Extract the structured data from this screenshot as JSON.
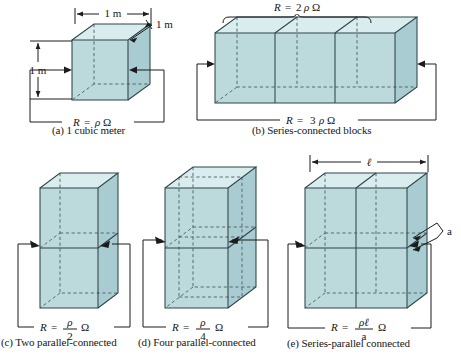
{
  "figure": {
    "background_color": "#ffffff",
    "block_colors": {
      "front_face": "#bcd9dc",
      "top_face": "#d9ecee",
      "side_face": "#a8ccd1",
      "edge": "#2f4449",
      "hidden_edge": "#4b5f64",
      "wire": "#1c1c1c"
    }
  },
  "panels": [
    {
      "id": "a",
      "caption": "(a) 1 cubic meter",
      "resistance_label": "R = ρΩ",
      "resistance_parts": {
        "r": "R",
        "eq": "=",
        "rho": "ρ",
        "ohm": "Ω"
      },
      "dimensions": {
        "width": "1 m",
        "height": "1 m",
        "depth": "1 m"
      },
      "block_count": 1,
      "arrangement": "single cube"
    },
    {
      "id": "b",
      "caption": "(b) Series-connected blocks",
      "resistance_label": "R = 3 ρΩ",
      "resistance_parts": {
        "r": "R",
        "eq": "=",
        "coef": "3",
        "rho": "ρ",
        "ohm": "Ω"
      },
      "brace_label": "R = 2 ρΩ",
      "brace_parts": {
        "r": "R",
        "eq": "=",
        "coef": "2",
        "rho": "ρ",
        "ohm": "Ω"
      },
      "block_count": 3,
      "arrangement": "three cubes in a row"
    },
    {
      "id": "c",
      "caption": "(c) Two parallel-connected",
      "resistance_label": "R = ρ/2 Ω",
      "resistance_parts": {
        "r": "R",
        "eq": "=",
        "num": "ρ",
        "den": "2",
        "ohm": "Ω"
      },
      "block_count": 2,
      "arrangement": "two cubes stacked vertically"
    },
    {
      "id": "d",
      "caption": "(d) Four parallel-connected",
      "resistance_label": "R = ρ/4 Ω",
      "resistance_parts": {
        "r": "R",
        "eq": "=",
        "num": "ρ",
        "den": "4",
        "ohm": "Ω"
      },
      "block_count": 4,
      "arrangement": "two by two stack, two deep"
    },
    {
      "id": "e",
      "caption": "(e) Series-parallel connected",
      "resistance_label": "R = ρℓ/a Ω",
      "resistance_parts": {
        "r": "R",
        "eq": "=",
        "num": "ρℓ",
        "den": "a",
        "ohm": "Ω"
      },
      "dimensions": {
        "length": "ℓ",
        "area": "a"
      },
      "block_count": 4,
      "arrangement": "two by two grid forming a slab"
    }
  ]
}
